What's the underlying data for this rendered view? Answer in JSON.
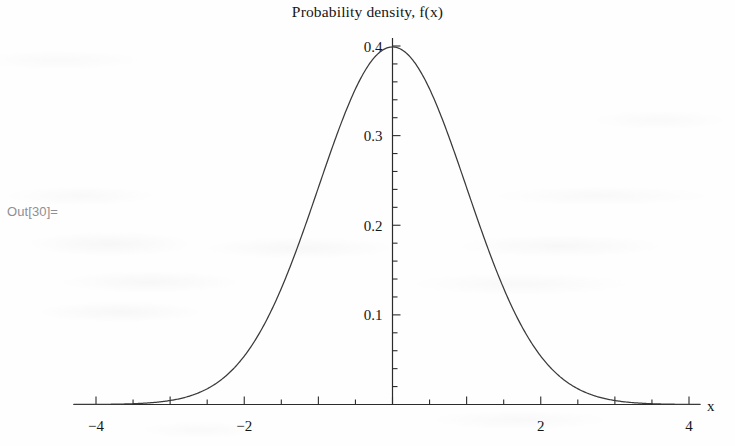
{
  "notebook": {
    "out_label": "Out[30]="
  },
  "chart_data": {
    "type": "line",
    "title": "Probability density, f(x)",
    "xlabel": "x",
    "ylabel": "",
    "function": "standard normal probability density",
    "formula": "f(x) = (1/sqrt(2*pi)) * exp(-x^2/2)",
    "mean": 0,
    "sigma": 1,
    "peak_value": 0.3989,
    "xlim": [
      -4.3,
      4.15
    ],
    "ylim": [
      0,
      0.42
    ],
    "grid": false,
    "legend": null,
    "x_ticks_major": [
      -4,
      -2,
      0,
      2,
      4
    ],
    "x_tick_labels": [
      "-4",
      "-2",
      "",
      "2",
      "4"
    ],
    "x_ticks_minor_step": 0.5,
    "y_ticks_major": [
      0.1,
      0.2,
      0.3,
      0.4
    ],
    "y_tick_labels": [
      "0.1",
      "0.2",
      "0.3",
      "0.4"
    ],
    "y_ticks_minor_step": 0.02,
    "x": [
      -4.3,
      -4,
      -3.75,
      -3.5,
      -3.25,
      -3,
      -2.75,
      -2.5,
      -2.25,
      -2,
      -1.75,
      -1.5,
      -1.25,
      -1,
      -0.75,
      -0.5,
      -0.25,
      0,
      0.25,
      0.5,
      0.75,
      1,
      1.25,
      1.5,
      1.75,
      2,
      2.25,
      2.5,
      2.75,
      3,
      3.25,
      3.5,
      3.75,
      4,
      4.15
    ],
    "y": [
      4e-05,
      0.00013,
      0.00035,
      0.00087,
      0.00203,
      0.00443,
      0.00909,
      0.01753,
      0.03174,
      0.05399,
      0.08628,
      0.12952,
      0.18265,
      0.24197,
      0.30114,
      0.35207,
      0.38667,
      0.39894,
      0.38667,
      0.35207,
      0.30114,
      0.24197,
      0.18265,
      0.12952,
      0.08628,
      0.05399,
      0.03174,
      0.01753,
      0.00909,
      0.00443,
      0.00203,
      0.00087,
      0.00035,
      0.00013,
      7e-05
    ],
    "colors": {
      "curve": "#3a3a3a",
      "axis": "#2b2b2b",
      "text": "#161616",
      "out_label": "#8f8f93",
      "background": "#fefefe"
    }
  }
}
